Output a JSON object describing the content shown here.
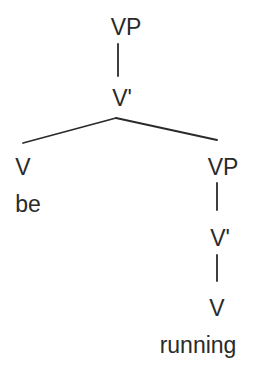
{
  "diagram": {
    "type": "syntax-tree",
    "nodes": {
      "root_vp": {
        "label": "VP"
      },
      "root_vbar": {
        "label": "V'"
      },
      "left_v": {
        "label": "V"
      },
      "left_word": {
        "label": "be"
      },
      "right_vp": {
        "label": "VP"
      },
      "right_vbar": {
        "label": "V'"
      },
      "right_v": {
        "label": "V"
      },
      "right_word": {
        "label": "running"
      }
    },
    "edges": [
      {
        "from": "VP",
        "to": "V'"
      },
      {
        "from": "V'",
        "to": "V"
      },
      {
        "from": "V'",
        "to": "VP"
      },
      {
        "from": "VP",
        "to": "V'"
      },
      {
        "from": "V'",
        "to": "V"
      }
    ],
    "colors": {
      "ink": "#2a2a2a",
      "background": "#ffffff"
    }
  }
}
